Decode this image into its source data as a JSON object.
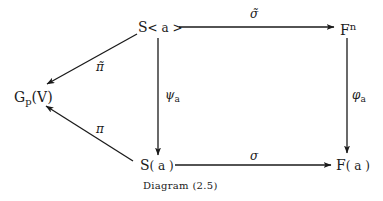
{
  "diagram": {
    "caption": "Diagram (2.5)",
    "nodes": {
      "s_angle": {
        "base": "S",
        "arg": "< a >"
      },
      "f_n": {
        "base": "F",
        "sup": "n"
      },
      "g_p_v": {
        "base": "G",
        "sub": "p",
        "arg": "(V)"
      },
      "s_paren": {
        "base": "S",
        "arg": "( a )"
      },
      "f_paren": {
        "base": "F",
        "arg": "( a )"
      }
    },
    "edges": {
      "sigma_tilde": {
        "label": "σ̃",
        "from": "S<a>",
        "to": "F^n"
      },
      "sigma": {
        "label": "σ",
        "from": "S(a)",
        "to": "F(a)"
      },
      "psi_a": {
        "label": "ψ",
        "sub": "a",
        "from": "S<a>",
        "to": "S(a)"
      },
      "phi_a": {
        "label": "φ",
        "sub": "a",
        "from": "F^n",
        "to": "F(a)"
      },
      "pi_tilde": {
        "label": "π̃",
        "from": "S<a>",
        "to": "G_p(V)"
      },
      "pi": {
        "label": "π",
        "from": "S(a)",
        "to": "G_p(V)"
      }
    },
    "colors": {
      "ink": "#1a1a1a",
      "background": "#ffffff"
    }
  }
}
